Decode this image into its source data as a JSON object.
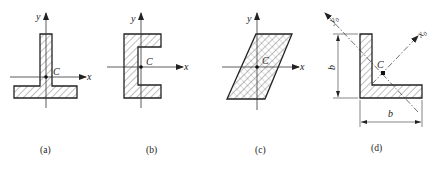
{
  "figures": [
    {
      "id": "a",
      "shape": "T-section (inverted T)",
      "caption": "(a)",
      "axis_labels": {
        "x": "x",
        "y": "y"
      },
      "centroid_label": "C"
    },
    {
      "id": "b",
      "shape": "channel section",
      "caption": "(b)",
      "axis_labels": {
        "x": "x",
        "y": "y"
      },
      "centroid_label": "C"
    },
    {
      "id": "c",
      "shape": "parallelogram",
      "caption": "(c)",
      "axis_labels": {
        "x": "x",
        "y": "y"
      },
      "centroid_label": "C"
    },
    {
      "id": "d",
      "shape": "equal-leg angle section",
      "caption": "(d)",
      "axis_labels": {
        "x": "x",
        "y": "y",
        "sub": "0"
      },
      "centroid_label": "C",
      "dimensions": {
        "height": "b",
        "width": "b"
      }
    }
  ],
  "colors": {
    "line": "#222222",
    "background": "#ffffff"
  }
}
